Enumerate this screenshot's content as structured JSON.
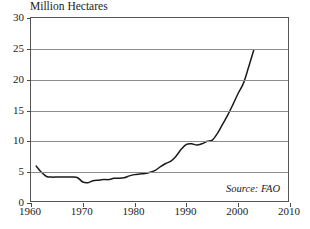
{
  "chart_data": {
    "type": "line",
    "title": "Million Hectares",
    "xlabel": "",
    "ylabel": "Million Hectares",
    "xlim": [
      1960,
      2010
    ],
    "ylim": [
      0,
      30
    ],
    "grid": true,
    "legend": false,
    "annotations": [
      {
        "name": "source-note",
        "text": "Source: FAO"
      }
    ],
    "yticks": [
      0,
      5,
      10,
      15,
      20,
      25,
      30
    ],
    "ytick_labels": [
      "0",
      "5",
      "10",
      "15",
      "20",
      "25",
      "30"
    ],
    "xticks": [
      1960,
      1970,
      1980,
      1990,
      2000,
      2010
    ],
    "xtick_labels": [
      "1960",
      "1970",
      "1980",
      "1990",
      "2000",
      "2010"
    ],
    "line_color": "#1a1a1a",
    "grid_color": "#8c8c8c",
    "series": [
      {
        "name": "Area",
        "x": [
          1961,
          1962,
          1963,
          1964,
          1965,
          1966,
          1967,
          1968,
          1969,
          1970,
          1971,
          1972,
          1973,
          1974,
          1975,
          1976,
          1977,
          1978,
          1979,
          1980,
          1981,
          1982,
          1983,
          1984,
          1985,
          1986,
          1987,
          1988,
          1989,
          1990,
          1991,
          1992,
          1993,
          1994,
          1995,
          1996,
          1997,
          1998,
          1999,
          2000,
          2001,
          2002,
          2003
        ],
        "values": [
          6.0,
          5.0,
          4.3,
          4.2,
          4.2,
          4.2,
          4.2,
          4.2,
          4.1,
          3.4,
          3.3,
          3.6,
          3.7,
          3.8,
          3.8,
          4.0,
          4.0,
          4.1,
          4.4,
          4.6,
          4.7,
          4.8,
          5.0,
          5.3,
          5.9,
          6.4,
          6.8,
          7.6,
          8.7,
          9.5,
          9.6,
          9.4,
          9.6,
          10.0,
          10.2,
          11.3,
          12.8,
          14.3,
          16.0,
          17.8,
          19.4,
          22.0,
          24.8
        ]
      }
    ]
  }
}
